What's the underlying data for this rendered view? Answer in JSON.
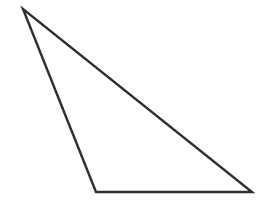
{
  "figure": {
    "name": "scalene-triangle",
    "kind": "line-drawing",
    "canvas": {
      "width": 265,
      "height": 208,
      "background_color": "#ffffff"
    },
    "shape": {
      "type": "triangle",
      "label": "triangle",
      "fill": "none",
      "stroke_color": "#2f2f2f",
      "stroke_width": 2.4,
      "vertices": [
        {
          "name": "apex-top-left",
          "x": 23,
          "y": 9
        },
        {
          "name": "bottom-left",
          "x": 96,
          "y": 192
        },
        {
          "name": "bottom-right",
          "x": 252,
          "y": 192
        }
      ],
      "points_attr": "23,9 96,192 252,192",
      "edges": [
        {
          "name": "left-edge",
          "from": "apex-top-left",
          "to": "bottom-left"
        },
        {
          "name": "bottom-edge",
          "from": "bottom-left",
          "to": "bottom-right"
        },
        {
          "name": "hypotenuse",
          "from": "bottom-right",
          "to": "apex-top-left"
        }
      ]
    }
  }
}
